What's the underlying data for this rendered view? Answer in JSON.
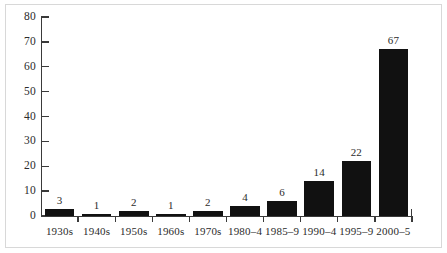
{
  "chart_data": {
    "type": "bar",
    "title": "",
    "subtitle": "",
    "xlabel": "",
    "ylabel": "",
    "categories": [
      "1930s",
      "1940s",
      "1950s",
      "1960s",
      "1970s",
      "1980–4",
      "1985–9",
      "1990–4",
      "1995–9",
      "2000–5"
    ],
    "values": [
      3,
      1,
      2,
      1,
      2,
      4,
      6,
      14,
      22,
      67
    ],
    "data_labels": [
      "3",
      "1",
      "2",
      "1",
      "2",
      "4",
      "6",
      "14",
      "22",
      "67"
    ],
    "ylim": [
      0,
      80
    ],
    "ytick_labels": [
      "0",
      "10",
      "20",
      "30",
      "40",
      "50",
      "60",
      "70",
      "80"
    ],
    "ytick_values": [
      0,
      10,
      20,
      30,
      40,
      50,
      60,
      70,
      80
    ],
    "grid": false,
    "legend": null,
    "legend_position": "none",
    "bar_color": "#111111",
    "axis_color": "#3a3a3a",
    "text_color": "#2b2b2b",
    "background_color": "#ffffff",
    "frame_border_color": "#d8d8d8"
  }
}
